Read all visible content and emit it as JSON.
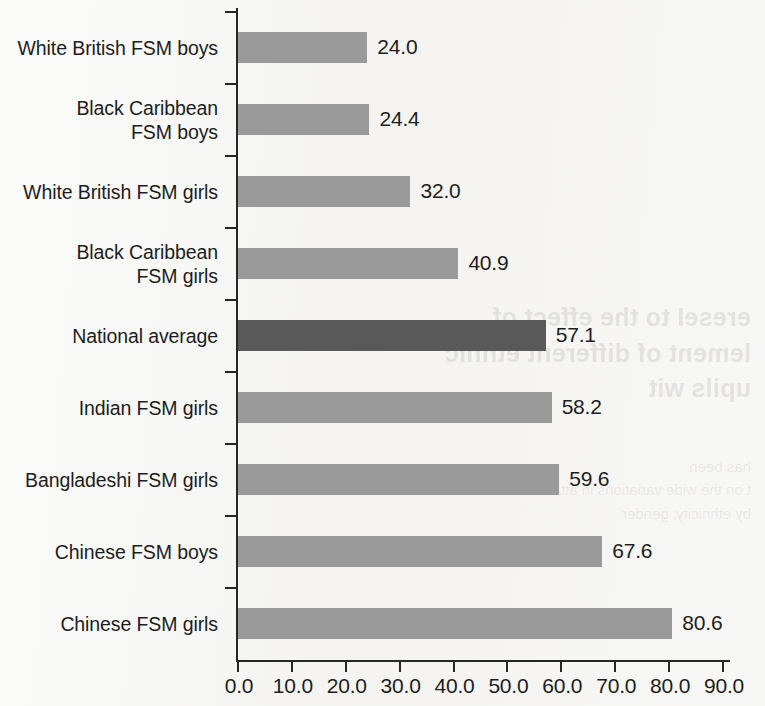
{
  "chart_data": {
    "type": "bar",
    "orientation": "horizontal",
    "title": "",
    "subtitle": "",
    "xlabel": "",
    "ylabel": "",
    "xlim": [
      0.0,
      90.0
    ],
    "xticks": [
      "0.0",
      "10.0",
      "20.0",
      "30.0",
      "40.0",
      "50.0",
      "60.0",
      "70.0",
      "80.0",
      "90.0"
    ],
    "grid": false,
    "legend": null,
    "categories": [
      "White British FSM boys",
      "Black Caribbean\nFSM boys",
      "White British FSM girls",
      "Black Caribbean\nFSM girls",
      "National average",
      "Indian FSM girls",
      "Bangladeshi FSM girls",
      "Chinese FSM boys",
      "Chinese FSM girls"
    ],
    "values": [
      24.0,
      24.4,
      32.0,
      40.9,
      57.1,
      58.2,
      59.6,
      67.6,
      80.6
    ],
    "value_labels": [
      "24.0",
      "24.4",
      "32.0",
      "40.9",
      "57.1",
      "58.2",
      "59.6",
      "67.6",
      "80.6"
    ],
    "highlight_index": 4,
    "colors": {
      "bar": "#9a9a9a",
      "bar_highlight": "#595959",
      "axis": "#272727",
      "text": "#1d1d1d",
      "background": "#fbfbfa"
    }
  },
  "showthrough": {
    "heading": "ereseI to the effect of\nlement of different ethnic\nupils wit",
    "body": "has been\nt on the wide variations in attainment\nby ethnicity, gender"
  }
}
